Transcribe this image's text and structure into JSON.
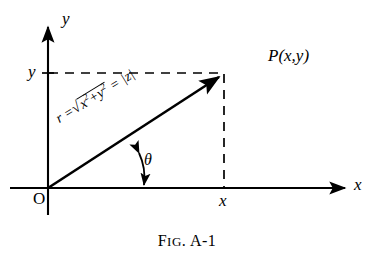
{
  "figure": {
    "caption_prefix": "F",
    "caption_smallcaps": "IG",
    "caption_suffix": ". A-1",
    "caption_full": "FIG. A-1",
    "stroke_color": "#000000",
    "background_color": "#ffffff"
  },
  "axes": {
    "x_label": "x",
    "y_label": "y",
    "origin_label": "O"
  },
  "labels": {
    "x_value": "x",
    "y_value": "y",
    "point": "P(x,y)",
    "theta": "θ"
  },
  "radius_expression": {
    "lead": "r =",
    "sqrt_sign": "√",
    "radicand_base_x": "x",
    "radicand_exp_x": "2",
    "radicand_plus": "+",
    "radicand_base_y": "y",
    "radicand_exp_y": "2",
    "equals": "=",
    "modulus": "|z|",
    "full_text": "r = √(x²+y²) = |z|"
  },
  "geometry": {
    "origin": [
      48,
      188
    ],
    "point_p": [
      224,
      73
    ],
    "x_axis_end": [
      350,
      188
    ],
    "y_axis_end": [
      48,
      22
    ],
    "angle_theta_degrees": 33
  }
}
